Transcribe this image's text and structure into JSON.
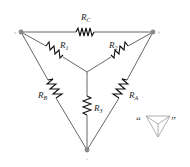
{
  "diagram": {
    "type": "delta-wye resistor network",
    "nodes": [
      {
        "id": "a",
        "label": "a"
      },
      {
        "id": "b",
        "label": "b"
      },
      {
        "id": "c",
        "label": "c"
      }
    ],
    "resistors": {
      "RC": {
        "main": "R",
        "sub": "C"
      },
      "R1": {
        "main": "R",
        "sub": "1"
      },
      "R2": {
        "main": "R",
        "sub": "2"
      },
      "R3": {
        "main": "R",
        "sub": "3"
      },
      "RA": {
        "main": "R",
        "sub": "A"
      },
      "RB": {
        "main": "R",
        "sub": "B"
      }
    },
    "icon": {
      "open_quote": "“",
      "close_quote": "”",
      "name": "delta-wye-symbol"
    },
    "colors": {
      "wire": "#555555",
      "resistor": "#111111",
      "node": "#888888"
    }
  }
}
